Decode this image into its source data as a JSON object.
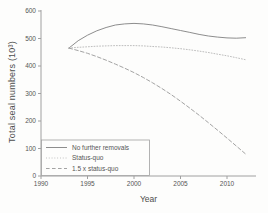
{
  "chart_data": {
    "type": "line",
    "title": "",
    "xlabel": "Year",
    "ylabel": "Total seal numbers (10³)",
    "xlim": [
      1990,
      2013
    ],
    "ylim": [
      0,
      600
    ],
    "x_ticks": [
      1990,
      1995,
      2000,
      2005,
      2010
    ],
    "y_ticks": [
      0,
      100,
      200,
      300,
      400,
      500,
      600
    ],
    "grid": false,
    "legend_position": "lower-left",
    "legend_border": true,
    "x": [
      1993,
      1994,
      1995,
      1996,
      1997,
      1998,
      1999,
      2000,
      2001,
      2002,
      2003,
      2004,
      2005,
      2006,
      2007,
      2008,
      2009,
      2010,
      2011,
      2012
    ],
    "series": [
      {
        "name": "No further removals",
        "line_style": "solid",
        "color": "#808080",
        "values": [
          465,
          492,
          512,
          528,
          540,
          549,
          553,
          555,
          553,
          549,
          543,
          536,
          529,
          522,
          515,
          509,
          505,
          502,
          501,
          503
        ]
      },
      {
        "name": "Status-quo",
        "line_style": "dotted",
        "color": "#b5b5b5",
        "values": [
          465,
          468,
          470,
          472,
          473,
          474,
          474,
          474,
          473,
          471,
          469,
          466,
          463,
          459,
          454,
          449,
          443,
          437,
          430,
          423
        ]
      },
      {
        "name": "1.5 x status-quo",
        "line_style": "dashed",
        "color": "#989898",
        "values": [
          465,
          456,
          446,
          434,
          421,
          407,
          392,
          376,
          358,
          339,
          318,
          296,
          272,
          247,
          221,
          194,
          166,
          138,
          109,
          80
        ]
      }
    ]
  },
  "colors": {
    "background": "#fdfdfc",
    "axis": "#a0a0a0",
    "tick_text": "#555555"
  }
}
